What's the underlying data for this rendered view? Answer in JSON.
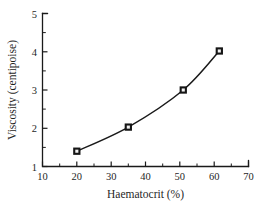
{
  "chart_data": {
    "type": "line",
    "title": "",
    "subtitle": "",
    "xlabel": "Haematocrit (%)",
    "ylabel": "Viscosity (centipoise)",
    "xlim": [
      10,
      70
    ],
    "ylim": [
      1,
      5
    ],
    "grid": false,
    "legend": null,
    "x_ticks": [
      10,
      20,
      30,
      40,
      50,
      60,
      70
    ],
    "x_tick_labels": [
      "10",
      "20",
      "30",
      "40",
      "50",
      "60",
      "70"
    ],
    "x_minor_ticks": [
      15,
      25,
      35,
      45,
      55,
      65
    ],
    "y_ticks": [
      1,
      2,
      3,
      4,
      5
    ],
    "y_tick_labels": [
      "1",
      "2",
      "3",
      "4",
      "5"
    ],
    "y_minor_ticks": [
      1.5,
      2.5,
      3.5,
      4.5
    ],
    "marker": "open-square",
    "line_color": "#1a1a1a",
    "marker_face_color": "#f2f2f2",
    "marker_edge_color": "#151515",
    "series": [
      {
        "name": "Viscosity vs Haematocrit",
        "x": [
          20,
          35,
          51,
          61.5
        ],
        "y": [
          1.4,
          2.03,
          3.0,
          4.02
        ]
      }
    ]
  },
  "axes": {
    "x_title": "Haematocrit (%)",
    "y_title": "Viscosity (centipoise)",
    "x_labels": [
      "10",
      "20",
      "30",
      "40",
      "50",
      "60",
      "70"
    ],
    "y_labels": [
      "1",
      "2",
      "3",
      "4",
      "5"
    ]
  }
}
